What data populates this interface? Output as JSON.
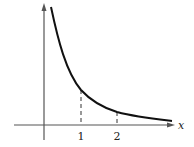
{
  "figure": {
    "type": "function-graph",
    "x_axis_label": "x",
    "ticks": [
      {
        "value": 1,
        "label": "1"
      },
      {
        "value": 2,
        "label": "2"
      }
    ],
    "colors": {
      "curve": "#111111",
      "axes": "#555555",
      "guides": "#333333"
    }
  }
}
